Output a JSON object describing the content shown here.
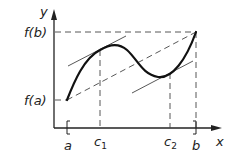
{
  "diagram": {
    "axes": {
      "x_label": "x",
      "y_label": "y"
    },
    "labels": {
      "fb": "f(b)",
      "fa": "f(a)",
      "a": "a",
      "c1": "c",
      "c1_sub": "1",
      "c2": "c",
      "c2_sub": "2",
      "b": "b"
    },
    "colors": {
      "stroke": "#222222",
      "dash": "#444444",
      "background": "#ffffff"
    }
  }
}
